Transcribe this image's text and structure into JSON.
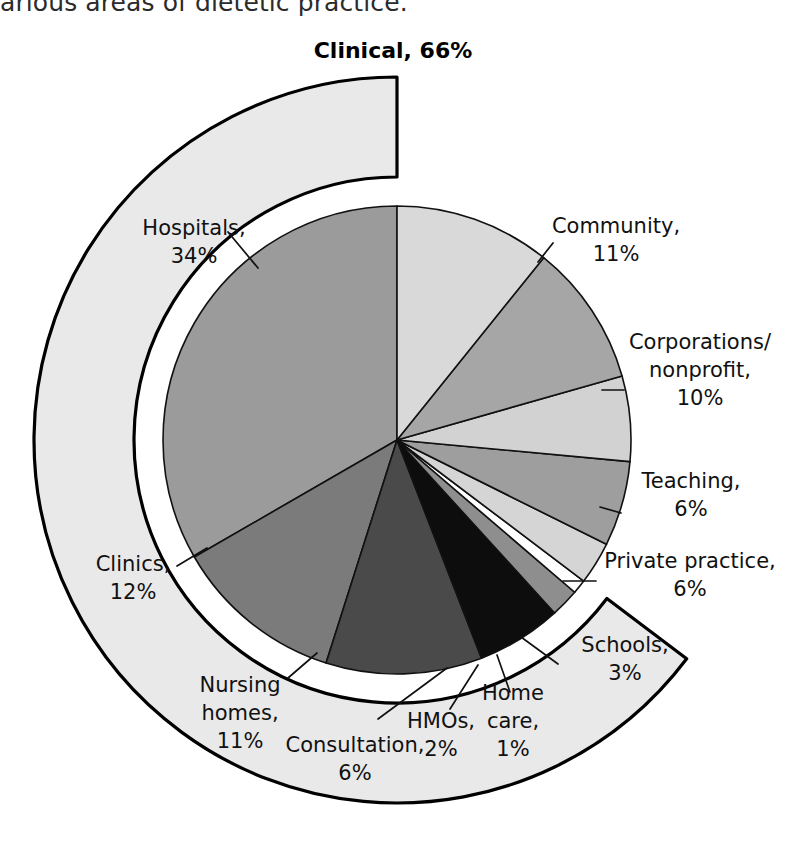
{
  "page": {
    "body_text_fragment": "arious areas of dietetic practice."
  },
  "chart_data": {
    "type": "pie",
    "title": "Clinical, 66%",
    "subtitle": "",
    "xlabel": "",
    "ylabel": "",
    "units": "percent",
    "legend_position": "none",
    "grid": false,
    "note": "Inner pie shows individual areas of dietetic practice; the outer detached arc groups the three clinical areas (Hospitals, Clinics, Nursing homes) totalling 66%.",
    "outer_group": {
      "label": "Clinical",
      "value": 66,
      "label_text": "Clinical, 66%",
      "members": [
        "Hospitals",
        "Clinics",
        "Nursing homes"
      ],
      "color": "#e9e9e9"
    },
    "labels": [
      "Hospitals",
      "Community",
      "Corporations/nonprofit",
      "Teaching",
      "Private practice",
      "Schools",
      "Home care",
      "HMOs",
      "Consultation",
      "Nursing homes",
      "Clinics"
    ],
    "values": [
      34,
      11,
      10,
      6,
      6,
      3,
      1,
      2,
      6,
      11,
      12
    ],
    "colors": [
      "#9b9b9b",
      "#d9d9d9",
      "#a6a6a6",
      "#d2d2d2",
      "#9e9e9e",
      "#d5d5d5",
      "#ffffff",
      "#8e8e8e",
      "#0d0d0d",
      "#4a4a4a",
      "#7b7b7b"
    ],
    "slices": [
      {
        "label": "Hospitals",
        "value": 34,
        "label_line1": "Hospitals,",
        "label_line2": "34%",
        "color": "#9b9b9b"
      },
      {
        "label": "Community",
        "value": 11,
        "label_line1": "Community,",
        "label_line2": "11%",
        "color": "#d9d9d9"
      },
      {
        "label": "Corporations/nonprofit",
        "value": 10,
        "label_line1": "Corporations/",
        "label_line2": "nonprofit,",
        "label_line3": "10%",
        "color": "#a6a6a6"
      },
      {
        "label": "Teaching",
        "value": 6,
        "label_line1": "Teaching,",
        "label_line2": "6%",
        "color": "#d2d2d2"
      },
      {
        "label": "Private practice",
        "value": 6,
        "label_line1": "Private practice,",
        "label_line2": "6%",
        "color": "#9e9e9e"
      },
      {
        "label": "Schools",
        "value": 3,
        "label_line1": "Schools,",
        "label_line2": "3%",
        "color": "#d5d5d5"
      },
      {
        "label": "Home care",
        "value": 1,
        "label_line1": "Home",
        "label_line2": "care,",
        "label_line3": "1%",
        "color": "#ffffff"
      },
      {
        "label": "HMOs",
        "value": 2,
        "label_line1": "HMOs,",
        "label_line2": "2%",
        "color": "#8e8e8e"
      },
      {
        "label": "Consultation",
        "value": 6,
        "label_line1": "Consultation,",
        "label_line2": "6%",
        "color": "#0d0d0d"
      },
      {
        "label": "Nursing homes",
        "value": 11,
        "label_line1": "Nursing",
        "label_line2": "homes,",
        "label_line3": "11%",
        "color": "#4a4a4a"
      },
      {
        "label": "Clinics",
        "value": 12,
        "label_line1": "Clinics,",
        "label_line2": "12%",
        "color": "#7b7b7b"
      }
    ]
  }
}
